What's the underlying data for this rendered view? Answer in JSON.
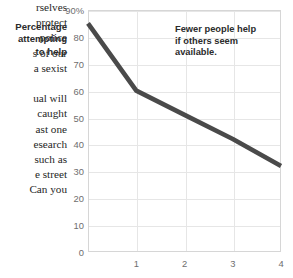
{
  "page": {
    "width": 293,
    "height": 278,
    "background": "#ffffff"
  },
  "body_text": {
    "paragraph_1_lines": [
      "rselves",
      "protect",
      "police",
      "s of our",
      "a sexist"
    ],
    "paragraph_2_lines": [
      "ual will",
      "caught",
      "ast one",
      "esearch",
      "such as",
      "e street",
      "Can you"
    ]
  },
  "chart_data": {
    "type": "line",
    "title": "",
    "ylabel": "Percentage attempting to help",
    "ylabel_lines": [
      "Percentage",
      "attempting",
      "to help"
    ],
    "xlabel": "",
    "x": [
      0,
      1,
      2,
      3,
      4
    ],
    "values": [
      85,
      60,
      51,
      42,
      32
    ],
    "xlim": [
      0,
      4
    ],
    "ylim": [
      0,
      90
    ],
    "yticks": [
      0,
      10,
      20,
      30,
      40,
      50,
      60,
      70,
      80,
      90
    ],
    "ytick_labels": [
      "0",
      "10",
      "20",
      "30",
      "40",
      "50",
      "60",
      "70",
      "80",
      "90%"
    ],
    "xticks": [
      1,
      2,
      3,
      4
    ],
    "xtick_labels": [
      "1",
      "2",
      "3",
      "4"
    ],
    "grid": true,
    "legend": "none",
    "line_color": "#4a4a4a",
    "grid_color": "#e6e6e6",
    "axis_color": "#d6d6d6",
    "tick_label_color": "#6e6e6e",
    "annotations": [
      {
        "lines": [
          "Fewer people help",
          "if others seem",
          "available."
        ],
        "text": "Fewer people help if others seem available."
      }
    ]
  }
}
